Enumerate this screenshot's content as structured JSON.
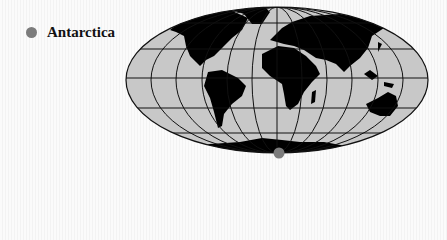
{
  "legend": {
    "label": "Antarctica",
    "marker_color": "#7c7c7c"
  },
  "map": {
    "projection": "Mollweide (world)",
    "ocean_color": "#c8c8c8",
    "land_color": "#000000",
    "highlighted_region": "Antarctica",
    "highlight_marker_color": "#7c7c7c"
  }
}
